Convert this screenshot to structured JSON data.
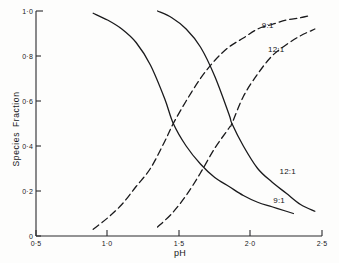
{
  "chart_data": {
    "type": "line",
    "title": "",
    "xlabel": "pH",
    "ylabel": "Species  Fraction",
    "xlim": [
      0.5,
      2.5
    ],
    "ylim": [
      0.0,
      1.0
    ],
    "grid": false,
    "legend_position": "inline-annotations",
    "x_ticks": [
      "0·5",
      "1·0",
      "1·5",
      "2·0",
      "2·5"
    ],
    "x_tick_values": [
      0.5,
      1.0,
      1.5,
      2.0,
      2.5
    ],
    "y_ticks": [
      "0",
      "0·2",
      "0·4",
      "0·6",
      "0·8",
      "1·0"
    ],
    "y_tick_values": [
      0.0,
      0.2,
      0.4,
      0.6,
      0.8,
      1.0
    ],
    "series": [
      {
        "name": "9:1 descending",
        "label": "9:1",
        "style": "solid",
        "color": "#1a1a1c",
        "x": [
          0.9,
          1.0,
          1.1,
          1.2,
          1.3,
          1.4,
          1.46,
          1.55,
          1.65,
          1.75,
          1.85,
          1.95,
          2.05,
          2.15,
          2.25,
          2.3
        ],
        "y": [
          0.99,
          0.96,
          0.92,
          0.86,
          0.76,
          0.61,
          0.5,
          0.4,
          0.32,
          0.26,
          0.22,
          0.18,
          0.15,
          0.13,
          0.11,
          0.1
        ]
      },
      {
        "name": "12:1 descending",
        "label": "12:1",
        "style": "solid",
        "color": "#1a1a1c",
        "x": [
          1.35,
          1.45,
          1.55,
          1.65,
          1.75,
          1.85,
          1.87,
          1.95,
          2.05,
          2.15,
          2.25,
          2.35,
          2.45
        ],
        "y": [
          1.0,
          0.97,
          0.92,
          0.84,
          0.71,
          0.54,
          0.5,
          0.4,
          0.3,
          0.24,
          0.19,
          0.14,
          0.11
        ]
      },
      {
        "name": "9:1 ascending",
        "label": "9:1",
        "style": "dashed",
        "color": "#1a1a1c",
        "x": [
          0.9,
          1.0,
          1.1,
          1.2,
          1.3,
          1.4,
          1.46,
          1.55,
          1.65,
          1.75,
          1.85,
          1.95,
          2.05,
          2.15,
          2.25,
          2.35,
          2.42
        ],
        "y": [
          0.03,
          0.08,
          0.14,
          0.22,
          0.3,
          0.42,
          0.5,
          0.6,
          0.7,
          0.78,
          0.84,
          0.88,
          0.92,
          0.94,
          0.96,
          0.97,
          0.98
        ]
      },
      {
        "name": "12:1 ascending",
        "label": "12:1",
        "style": "dashed",
        "color": "#1a1a1c",
        "x": [
          1.35,
          1.45,
          1.55,
          1.65,
          1.75,
          1.85,
          1.87,
          1.95,
          2.05,
          2.15,
          2.25,
          2.35,
          2.45
        ],
        "y": [
          0.04,
          0.1,
          0.18,
          0.28,
          0.39,
          0.48,
          0.5,
          0.62,
          0.72,
          0.8,
          0.85,
          0.89,
          0.92
        ]
      }
    ],
    "annotations": [
      {
        "text": "9:1",
        "x": 2.12,
        "y": 0.94,
        "series": "9:1 ascending"
      },
      {
        "text": "12:1",
        "x": 2.18,
        "y": 0.83,
        "series": "12:1 ascending"
      },
      {
        "text": "12:1",
        "x": 2.26,
        "y": 0.29,
        "series": "12:1 descending"
      },
      {
        "text": "9:1",
        "x": 2.2,
        "y": 0.16,
        "series": "9:1 descending"
      }
    ]
  }
}
